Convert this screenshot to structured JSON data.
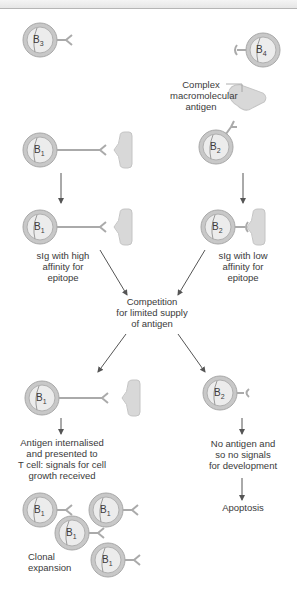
{
  "diagram": {
    "cells": {
      "b3": {
        "letter": "B",
        "sub": "3"
      },
      "b4": {
        "letter": "B",
        "sub": "4"
      },
      "b1_top": {
        "letter": "B",
        "sub": "1"
      },
      "b2_top": {
        "letter": "B",
        "sub": "2"
      },
      "b1_mid": {
        "letter": "B",
        "sub": "1"
      },
      "b2_mid": {
        "letter": "B",
        "sub": "2"
      },
      "b1_sel": {
        "letter": "B",
        "sub": "1"
      },
      "b2_sel": {
        "letter": "B",
        "sub": "2"
      },
      "clone1": {
        "letter": "B",
        "sub": "1"
      },
      "clone2": {
        "letter": "B",
        "sub": "1"
      },
      "clone3": {
        "letter": "B",
        "sub": "1"
      },
      "clone4": {
        "letter": "B",
        "sub": "1"
      }
    },
    "labels": {
      "antigen": [
        "Complex",
        "macromolecular",
        "antigen"
      ],
      "high_affinity": [
        "sIg with high",
        "affinity for",
        "epitope"
      ],
      "low_affinity": [
        "sIg with low",
        "affinity for",
        "epitope"
      ],
      "competition": [
        "Competition",
        "for limited supply",
        "of antigen"
      ],
      "internalised": [
        "Antigen internalised",
        "and presented to",
        "T cell: signals for cell",
        "growth received"
      ],
      "no_antigen": [
        "No antigen and",
        "so no signals",
        "for development"
      ],
      "apoptosis": "Apoptosis",
      "clonal": [
        "Clonal",
        "expansion"
      ]
    },
    "colors": {
      "cell_outer": "#bdbdbd",
      "cell_inner": "#e9e9e9",
      "antigen": "#d6d6d6",
      "arrow": "#555555"
    }
  }
}
